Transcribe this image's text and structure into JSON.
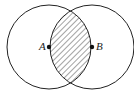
{
  "diagram": {
    "type": "venn-intersection",
    "circles": [
      {
        "name": "circle-A",
        "cx": 49,
        "cy": 47,
        "r": 42
      },
      {
        "name": "circle-B",
        "cx": 92,
        "cy": 47,
        "r": 42
      }
    ],
    "points": [
      {
        "label": "A",
        "x": 49,
        "y": 47
      },
      {
        "label": "B",
        "x": 92,
        "y": 47
      }
    ],
    "shaded_region": "intersection",
    "colors": {
      "stroke": "#222222",
      "fill": "#ffffff"
    }
  }
}
